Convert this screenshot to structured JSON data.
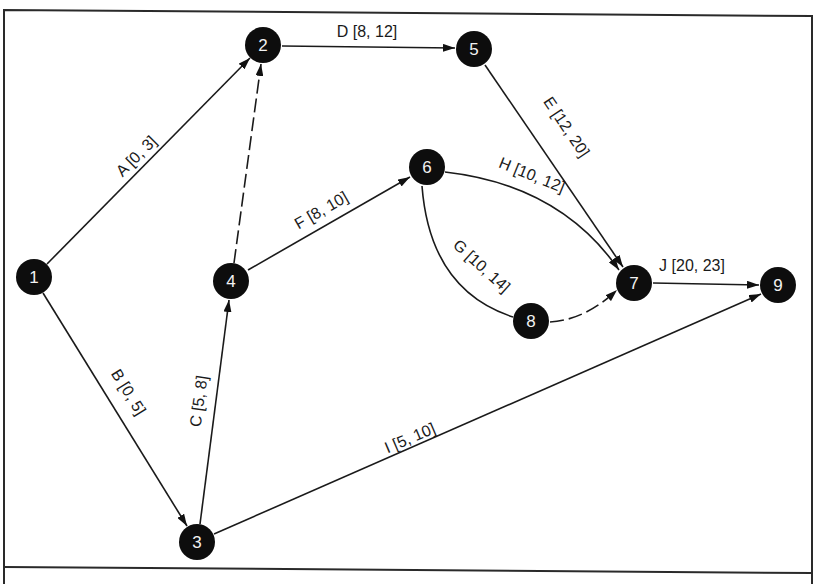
{
  "diagram": {
    "type": "activity-on-arrow network",
    "nodes": [
      {
        "id": "1",
        "label": "1",
        "x": 34,
        "y": 277
      },
      {
        "id": "2",
        "label": "2",
        "x": 263,
        "y": 45
      },
      {
        "id": "3",
        "label": "3",
        "x": 197,
        "y": 542
      },
      {
        "id": "4",
        "label": "4",
        "x": 231,
        "y": 281
      },
      {
        "id": "5",
        "label": "5",
        "x": 474,
        "y": 49
      },
      {
        "id": "6",
        "label": "6",
        "x": 427,
        "y": 167
      },
      {
        "id": "7",
        "label": "7",
        "x": 634,
        "y": 283
      },
      {
        "id": "8",
        "label": "8",
        "x": 531,
        "y": 321
      },
      {
        "id": "9",
        "label": "9",
        "x": 778,
        "y": 285
      }
    ],
    "edges": [
      {
        "id": "A",
        "label": "A [0, 3]",
        "from": "1",
        "to": "2",
        "dummy": false
      },
      {
        "id": "B",
        "label": "B [0, 5]",
        "from": "1",
        "to": "3",
        "dummy": false
      },
      {
        "id": "C",
        "label": "C [5, 8]",
        "from": "3",
        "to": "4",
        "dummy": false
      },
      {
        "id": "D",
        "label": "D [8, 12]",
        "from": "2",
        "to": "5",
        "dummy": false
      },
      {
        "id": "E",
        "label": "E [12, 20]",
        "from": "5",
        "to": "7",
        "dummy": false
      },
      {
        "id": "F",
        "label": "F [8, 10]",
        "from": "4",
        "to": "6",
        "dummy": false
      },
      {
        "id": "G",
        "label": "G [10, 14]",
        "from": "6",
        "to": "8",
        "dummy": false
      },
      {
        "id": "H",
        "label": "H [10, 12]",
        "from": "6",
        "to": "7",
        "dummy": false
      },
      {
        "id": "I",
        "label": "I [5, 10]",
        "from": "3",
        "to": "9",
        "dummy": false
      },
      {
        "id": "J",
        "label": "J [20, 23]",
        "from": "7",
        "to": "9",
        "dummy": false
      },
      {
        "id": "dummy-4-2",
        "label": "",
        "from": "4",
        "to": "2",
        "dummy": true
      },
      {
        "id": "dummy-8-7",
        "label": "",
        "from": "8",
        "to": "7",
        "dummy": true
      }
    ]
  }
}
